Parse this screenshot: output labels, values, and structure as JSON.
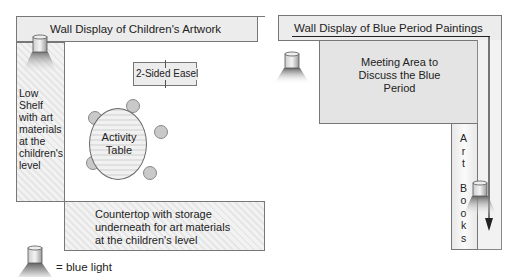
{
  "left_room": {
    "wall_display": "Wall Display of Children's Artwork",
    "low_shelf": [
      "Low",
      "Shelf",
      "with art",
      "materials",
      "at the",
      "children's",
      "level"
    ],
    "easel": "2-Sided Easel",
    "table": [
      "Activity",
      "Table"
    ],
    "countertop": [
      "Countertop with storage",
      "underneath for art materials",
      "at the children's level"
    ]
  },
  "right_room": {
    "wall_display": "Wall Display of Blue Period Paintings",
    "meeting_area": [
      "Meeting Area to",
      "Discuss the Blue",
      "Period"
    ],
    "art_books": [
      "A",
      "r",
      "t",
      "",
      "B",
      "o",
      "o",
      "k",
      "s"
    ]
  },
  "legend": {
    "icon": "blue-light-icon",
    "label": "= blue light"
  },
  "colors": {
    "wall_fill": "#ececec",
    "outline": "#777777",
    "meeting_fill": "#e4e4e4",
    "chair": "#c9c9c9"
  }
}
